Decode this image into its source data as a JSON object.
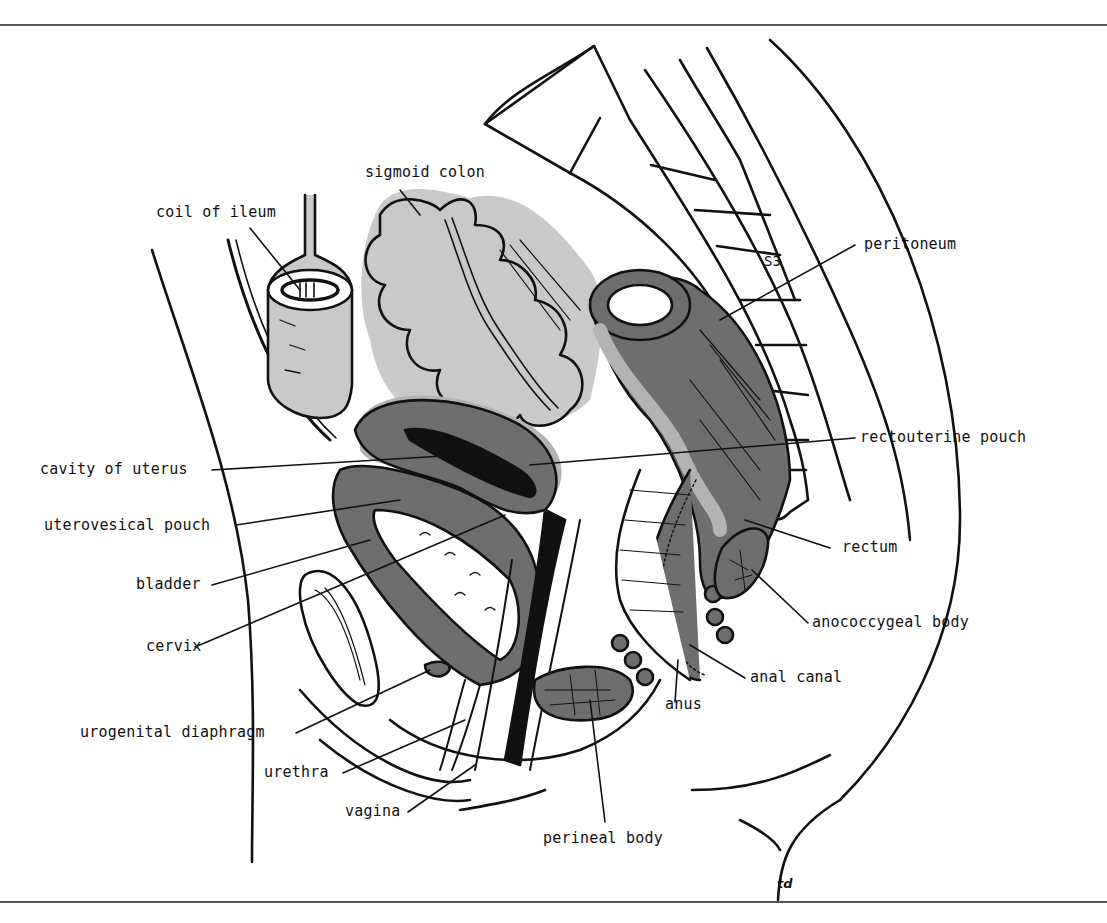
{
  "figure": {
    "artist_initials": "td",
    "vertebra_label": "S3",
    "colors": {
      "line": "#111111",
      "light_gray": "#c9c9c9",
      "mid_gray": "#b3b3b3",
      "dark_gray": "#6e6e6e",
      "black_fill": "#111111",
      "background": "#ffffff"
    }
  },
  "labels": {
    "sigmoid_colon": "sigmoid colon",
    "coil_of_ileum": "coil of ileum",
    "peritoneum": "peritoneum",
    "rectouterine_pouch": "rectouterine pouch",
    "cavity_of_uterus": "cavity of uterus",
    "uterovesical_pouch": "uterovesical pouch",
    "bladder": "bladder",
    "rectum": "rectum",
    "cervix": "cervix",
    "anococcygeal_body": "anococcygeal body",
    "anal_canal": "anal canal",
    "urogenital_diaphragm": "urogenital diaphragm",
    "anus": "anus",
    "urethra": "urethra",
    "vagina": "vagina",
    "perineal_body": "perineal body"
  }
}
